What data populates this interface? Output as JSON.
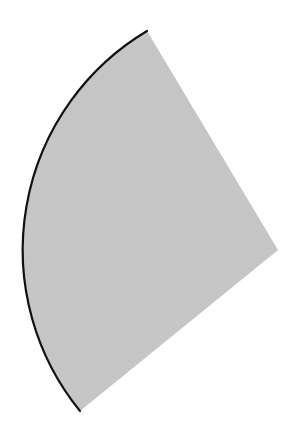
{
  "diagram": {
    "shape": "circular-sector",
    "apex": {
      "x": 278,
      "y": 250
    },
    "radius": 255,
    "arc_start": {
      "x": 147,
      "y": 31
    },
    "arc_end": {
      "x": 80,
      "y": 411
    },
    "colors": {
      "background": "#ffffff",
      "fill": "#c8c8c8",
      "arc_stroke": "#111111"
    },
    "arc_stroke_width": 2.2
  }
}
